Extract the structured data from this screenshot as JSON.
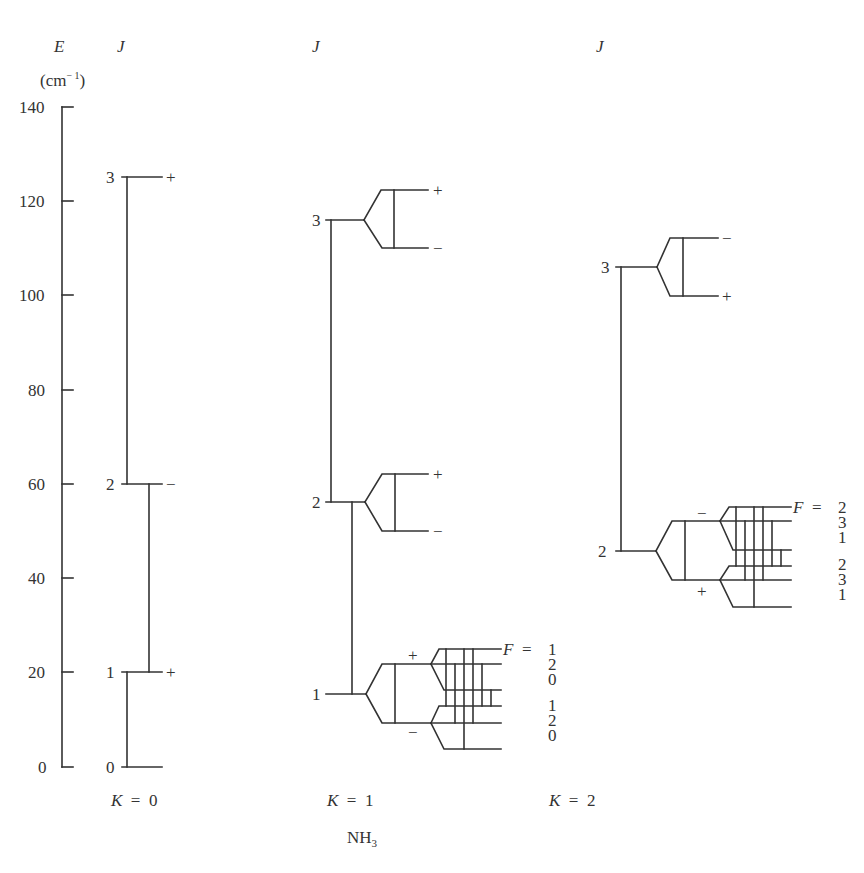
{
  "figure": {
    "molecule": "NH",
    "molecule_subscript": "3",
    "axis": {
      "label": "E",
      "unit_prefix": "(cm",
      "unit_exp": "− 1",
      "unit_suffix": ")",
      "ticks": [
        "0",
        "20",
        "40",
        "60",
        "80",
        "100",
        "120",
        "140"
      ],
      "range": [
        0,
        140
      ]
    },
    "column_header": "J",
    "columns": [
      {
        "k_label": "K",
        "k_eq": "=",
        "k_value": "0",
        "levels": [
          {
            "J": "0",
            "energy": 0,
            "parity": ""
          },
          {
            "J": "1",
            "energy": 20,
            "parity": "+"
          },
          {
            "J": "2",
            "energy": 60,
            "parity": "−"
          },
          {
            "J": "3",
            "energy": 125,
            "parity": "+"
          }
        ]
      },
      {
        "k_label": "K",
        "k_eq": "=",
        "k_value": "1",
        "levels": [
          {
            "J": "1",
            "energy": 15.5,
            "upper_parity": "+",
            "lower_parity": "−"
          },
          {
            "J": "2",
            "energy": 56,
            "upper_parity": "+",
            "lower_parity": "−"
          },
          {
            "J": "3",
            "energy": 116,
            "upper_parity": "+",
            "lower_parity": "−"
          }
        ],
        "hyperfine": {
          "F_label": "F",
          "F_eq": "=",
          "F_values": [
            "1",
            "2",
            "0",
            "1",
            "2",
            "0"
          ]
        }
      },
      {
        "k_label": "K",
        "k_eq": "=",
        "k_value": "2",
        "levels": [
          {
            "J": "2",
            "energy": 46,
            "upper_parity": "−",
            "lower_parity": "+"
          },
          {
            "J": "3",
            "energy": 106,
            "upper_parity": "−",
            "lower_parity": "+"
          }
        ],
        "hyperfine": {
          "F_label": "F",
          "F_eq": "=",
          "F_values": [
            "2",
            "3",
            "1",
            "2",
            "3",
            "1"
          ]
        }
      }
    ],
    "colors": {
      "ink": "#333333",
      "background": "#ffffff"
    }
  }
}
